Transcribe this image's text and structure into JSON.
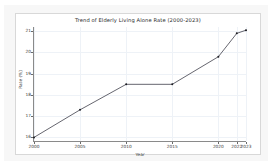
{
  "figure": {
    "background_color": "#f7f7f7",
    "plot_background_color": "#ffffff",
    "grid_color": "#eef2f7",
    "line_color": "#3f3f4a",
    "marker_color": "#1c1c22",
    "axis_color": "#8a8a8a"
  },
  "chart_data": {
    "type": "line",
    "title": "Trend of Elderly Living Alone Rate (2000-2023)",
    "xlabel": "Year",
    "ylabel": "Rate (%)",
    "x": [
      2000,
      2005,
      2010,
      2015,
      2020,
      2022,
      2023
    ],
    "values": [
      16.0,
      17.3,
      18.5,
      18.5,
      19.8,
      20.9,
      21.05
    ],
    "series": [
      {
        "name": "Elderly Living Alone Rate",
        "values": [
          16.0,
          17.3,
          18.5,
          18.5,
          19.8,
          20.9,
          21.05
        ]
      }
    ],
    "xlim": [
      2000,
      2023
    ],
    "ylim": [
      15.83,
      21.2
    ],
    "xticks": [
      2000,
      2005,
      2010,
      2015,
      2020,
      2022,
      2023
    ],
    "xtick_labels": [
      "2000",
      "2005",
      "2010",
      "2015",
      "2020",
      "2022",
      "2023"
    ],
    "yticks": [
      16,
      17,
      18,
      19,
      20,
      21
    ],
    "ytick_labels": [
      "16",
      "17",
      "18",
      "19",
      "20",
      "21"
    ],
    "grid": true,
    "legend": false,
    "marker": "point",
    "linewidth": 0.8
  }
}
